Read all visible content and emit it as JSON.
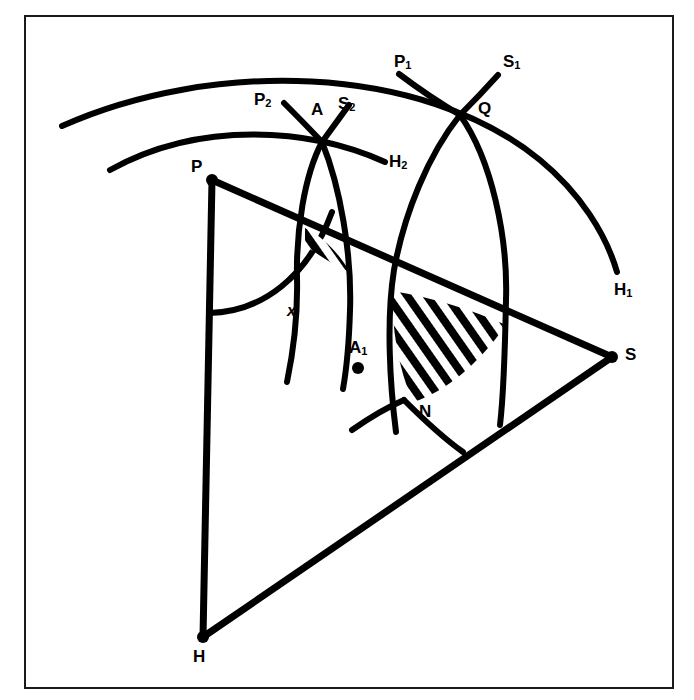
{
  "figure": {
    "background_color": "#ffffff",
    "ink_color": "#000000",
    "frame": {
      "x": 25,
      "y": 16,
      "width": 648,
      "height": 672,
      "stroke": "#1a1a1a",
      "stroke_width": 2
    },
    "stroke_width_main": 6,
    "stroke_width_arc": 5,
    "hatch_color": "#000000"
  },
  "points": [
    {
      "name": "P",
      "label": "P",
      "x": 212,
      "y": 180,
      "label_x": 191,
      "label_y": 162,
      "dot": true
    },
    {
      "name": "H",
      "label": "H",
      "x": 203,
      "y": 637,
      "label_x": 193,
      "label_y": 652,
      "dot": true
    },
    {
      "name": "S",
      "label": "S",
      "x": 612,
      "y": 357,
      "label_x": 625,
      "label_y": 346,
      "dot": true
    },
    {
      "name": "Q",
      "label": "Q",
      "x": 460,
      "y": 115,
      "label_x": 478,
      "label_y": 103,
      "dot": false
    },
    {
      "name": "A",
      "label": "A",
      "x": 322,
      "y": 142,
      "label_x": 311,
      "label_y": 105,
      "dot": false
    },
    {
      "name": "A1",
      "label": "A",
      "sub": "1",
      "x": 358,
      "y": 368,
      "label_x": 349,
      "label_y": 341,
      "dot": true
    },
    {
      "name": "N",
      "label": "N",
      "x": 413,
      "y": 402,
      "label_x": 419,
      "label_y": 404,
      "dot": false
    }
  ],
  "labels": [
    {
      "name": "label-P1",
      "text": "P",
      "sub": "1",
      "x": 394,
      "y": 55
    },
    {
      "name": "label-S1",
      "text": "S",
      "sub": "1",
      "x": 503,
      "y": 55
    },
    {
      "name": "label-P2",
      "text": "P",
      "sub": "2",
      "x": 254,
      "y": 93
    },
    {
      "name": "label-S2",
      "text": "S",
      "sub": "2",
      "x": 338,
      "y": 97
    },
    {
      "name": "label-H1",
      "text": "H",
      "sub": "1",
      "x": 614,
      "y": 283
    },
    {
      "name": "label-H2",
      "text": "H",
      "sub": "2",
      "x": 389,
      "y": 155
    },
    {
      "name": "label-x",
      "text": "x",
      "sub": "",
      "x": 287,
      "y": 305,
      "italic": true
    }
  ],
  "triangle": {
    "name": "triangle-PHS",
    "vertices": [
      [
        212,
        180
      ],
      [
        203,
        637
      ],
      [
        612,
        357
      ]
    ],
    "edges": [
      {
        "from": "P",
        "to": "H"
      },
      {
        "from": "H",
        "to": "S"
      },
      {
        "from": "P",
        "to": "S"
      }
    ]
  },
  "arcs": [
    {
      "name": "outer-arc-H1",
      "endpoint_label": "H1",
      "from": [
        62,
        126
      ],
      "to": [
        617,
        272
      ],
      "bulge": "up"
    },
    {
      "name": "inner-arc-H2",
      "endpoint_label": "H2",
      "from": [
        110,
        170
      ],
      "to": [
        385,
        162
      ],
      "bulge": "up"
    },
    {
      "name": "arc-P1-through-Q",
      "from": [
        399,
        74
      ],
      "to": [
        500,
        425
      ],
      "center_side": "left"
    },
    {
      "name": "arc-S1-through-Q",
      "from": [
        498,
        75
      ],
      "to": [
        396,
        432
      ],
      "center_side": "right"
    },
    {
      "name": "arc-P2-through-A",
      "from": [
        284,
        103
      ],
      "to": [
        343,
        389
      ],
      "center_side": "left"
    },
    {
      "name": "arc-S2-through-A",
      "from": [
        349,
        105
      ],
      "to": [
        287,
        382
      ],
      "center_side": "right"
    },
    {
      "name": "arc-radius-P",
      "from": [
        212,
        315
      ],
      "to": [
        330,
        205
      ],
      "center": "P"
    },
    {
      "name": "arc-N-to-HS",
      "from": [
        413,
        402
      ],
      "to": [
        462,
        452
      ]
    }
  ],
  "hatched_regions": [
    {
      "name": "small-hatched-lens",
      "approx_center": [
        312,
        254
      ],
      "stripe_angle_deg": -35,
      "stripe_count": 4
    },
    {
      "name": "large-hatched-lens",
      "approx_center": [
        447,
        330
      ],
      "stripe_angle_deg": -35,
      "stripe_count": 8
    }
  ]
}
